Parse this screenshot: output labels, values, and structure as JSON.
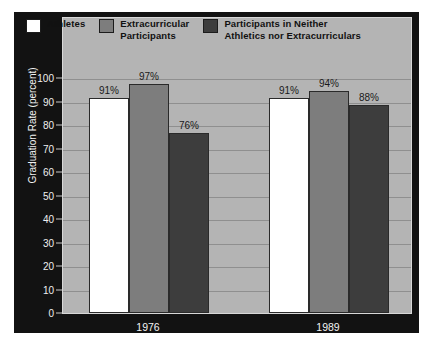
{
  "chart_data": {
    "type": "bar",
    "title": "",
    "xlabel": "",
    "ylabel": "Graduation Rate (percent)",
    "categories": [
      "1976",
      "1989"
    ],
    "ylim": [
      0,
      100
    ],
    "ytick_labels": [
      "0",
      "10",
      "20",
      "30",
      "40",
      "50",
      "60",
      "70",
      "80",
      "90",
      "100"
    ],
    "ytick_values": [
      0,
      10,
      20,
      30,
      40,
      50,
      60,
      70,
      80,
      90,
      100
    ],
    "grid": true,
    "legend_position": "top",
    "series": [
      {
        "name": "Athletes",
        "color": "#ffffff",
        "values": [
          91,
          91
        ],
        "value_labels": [
          "91%",
          "91%"
        ]
      },
      {
        "name": "Extracurricular\nParticipants",
        "color": "#7d7d7d",
        "values": [
          97,
          94
        ],
        "value_labels": [
          "97%",
          "94%"
        ]
      },
      {
        "name": "Participants in Neither\nAthletics nor Extracurriculars",
        "color": "#3d3d3d",
        "values": [
          76,
          88
        ],
        "value_labels": [
          "76%",
          "88%"
        ]
      }
    ]
  },
  "colors": {
    "figure_background": "#121212",
    "plot_background": "#b4b4b4",
    "gridline": "#8f8f8f",
    "axis_text": "#f2f2f2",
    "value_label_text": "#1a1a1a",
    "legend_text": "#111111",
    "bar_outline": "#2a2a2a",
    "page_background": "#ffffff"
  }
}
